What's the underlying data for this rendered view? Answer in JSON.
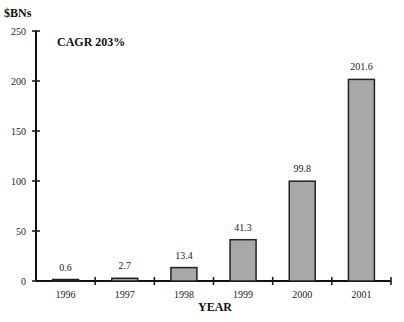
{
  "chart_data": {
    "type": "bar",
    "title": "CAGR 203%",
    "xlabel": "YEAR",
    "ylabel": "$BNs",
    "categories": [
      "1996",
      "1997",
      "1998",
      "1999",
      "2000",
      "2001"
    ],
    "values": [
      0.6,
      2.7,
      13.4,
      41.3,
      99.8,
      201.6
    ],
    "data_labels": [
      "0.6",
      "2.7",
      "13.4",
      "41.3",
      "99.8",
      "201.6"
    ],
    "ylim": [
      0,
      250
    ],
    "yticks": [
      0,
      50,
      100,
      150,
      200,
      250
    ],
    "grid": false,
    "legend": null,
    "bar_color": "#a8a8a8",
    "bar_edge_color": "#222222"
  }
}
